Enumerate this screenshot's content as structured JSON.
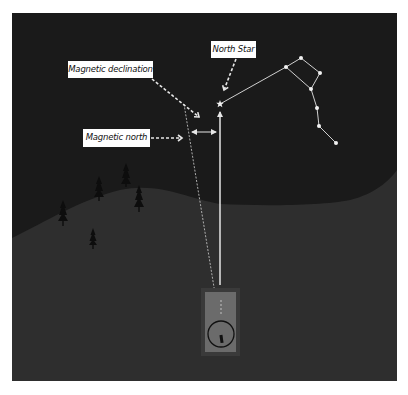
{
  "figure": {
    "colors": {
      "background": "#ffffff",
      "sky": "#1a1a1a",
      "hill": "#2c2c2c",
      "foreground": "#333333",
      "lines": "#e6e6e6",
      "trees": "#0d0d0d",
      "compass_outer": "#3a3a3a",
      "compass_inner": "#6b6b6b",
      "label_bg": "#ffffff",
      "label_text": "#111111"
    }
  },
  "labels": {
    "north_star": "North Star",
    "magnetic_declination": "Magnetic declination",
    "magnetic_north": "Magnetic north"
  },
  "constellation": {
    "name": "Big Dipper",
    "stars": [
      [
        286,
        67
      ],
      [
        301,
        58
      ],
      [
        320,
        73
      ],
      [
        311,
        89
      ],
      [
        317,
        108
      ],
      [
        319,
        126
      ],
      [
        336,
        143
      ]
    ]
  },
  "north_star": {
    "x": 220,
    "y": 104,
    "icon": "star-icon"
  },
  "trees": [
    [
      126,
      163
    ],
    [
      99,
      176
    ],
    [
      139,
      185
    ],
    [
      63,
      200
    ],
    [
      93,
      228
    ]
  ],
  "compass": {
    "icon": "compass-icon",
    "x": 201,
    "y": 288,
    "w": 39,
    "h": 68
  }
}
